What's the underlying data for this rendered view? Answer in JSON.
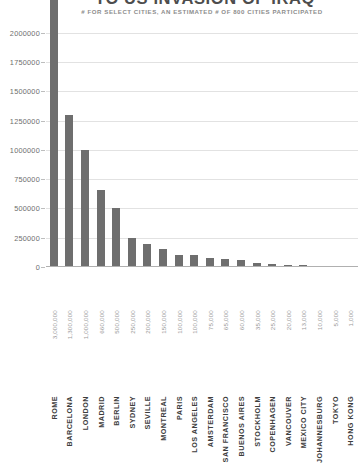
{
  "chart": {
    "title": "TO US INVASION OF IRAQ",
    "subtitle": "# FOR SELECT CITIES, AN ESTIMATED # OF 800 CITIES PARTICIPATED"
  },
  "chart_data": {
    "type": "bar",
    "title": "TO US INVASION OF IRAQ",
    "subtitle": "# FOR SELECT CITIES, AN ESTIMATED # OF 800 CITIES PARTICIPATED",
    "xlabel": "",
    "ylabel": "",
    "ylim": [
      0,
      2100000
    ],
    "grid": true,
    "legend": false,
    "yticks": [
      0,
      250000,
      500000,
      750000,
      1000000,
      1250000,
      1500000,
      1750000,
      2000000
    ],
    "ytick_labels": [
      "0",
      "250000",
      "500000",
      "750000",
      "1000000",
      "1250000",
      "1500000",
      "1750000",
      "2000000"
    ],
    "categories": [
      "ROME",
      "BARCELONA",
      "LONDON",
      "MADRID",
      "BERLIN",
      "SYDNEY",
      "SEVILLE",
      "MONTREAL",
      "PARIS",
      "LOS ANGELES",
      "AMSTERDAM",
      "SAN FRANCISCO",
      "BUENOS AIRES",
      "STOCKHOLM",
      "COPENHAGEN",
      "VANCOUVER",
      "MEXICO CITY",
      "JOHANNESBURG",
      "TOKYO",
      "HONG KONG"
    ],
    "values": [
      3000000,
      1300000,
      1000000,
      660000,
      500000,
      250000,
      200000,
      150000,
      100000,
      100000,
      75000,
      65000,
      60000,
      35000,
      25000,
      20000,
      13000,
      10000,
      5000,
      1000
    ],
    "value_labels": [
      "3,000,000",
      "1,300,000",
      "1,000,000",
      "660,000",
      "500,000",
      "250,000",
      "200,000",
      "150,000",
      "100,000",
      "100,000",
      "75,000",
      "65,000",
      "60,000",
      "35,000",
      "25,000",
      "20,000",
      "13,000",
      "10,000",
      "5,000",
      "1,000"
    ],
    "colors": {
      "bar": "#6e6e6e",
      "grid": "#e2e2e2",
      "axis": "#b0b0b0",
      "title_text": "#4d4d4d",
      "subtitle_text": "#8c8c8c",
      "tick_text": "#6e6e6e",
      "category_text": "#3d3d3d",
      "background": "#ffffff"
    }
  }
}
